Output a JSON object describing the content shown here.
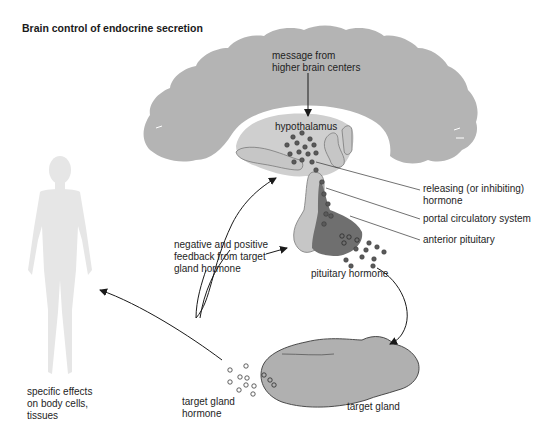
{
  "title": "Brain control of endocrine secretion",
  "colors": {
    "brain": "#b4b4b4",
    "hypothalamus": "#cfcfcf",
    "posterior_pituitary": "#c2c2c2",
    "anterior_pituitary": "#6f6f6f",
    "hormone_dot_dark": "#5a5a5a",
    "target_gland": "#b0b0b0",
    "body_silhouette": "#e6e6e6",
    "arrow": "#1a1a1a"
  },
  "labels": {
    "message": "message from\nhigher brain centers",
    "hypothalamus": "hypothalamus",
    "releasing_hormone": "releasing (or inhibiting)\nhormone",
    "portal_system": "portal circulatory system",
    "anterior_pituitary": "anterior pituitary",
    "feedback": "negative and positive\nfeedback from target\ngland hormone",
    "pituitary_hormone": "pituitary hormone",
    "target_gland_hormone": "target gland\nhormone",
    "target_gland": "target gland",
    "specific_effects": "specific effects\non body cells,\ntissues"
  },
  "structures": [
    {
      "name": "brain",
      "label": "higher brain centers"
    },
    {
      "name": "hypothalamus",
      "label": "hypothalamus"
    },
    {
      "name": "anterior pituitary",
      "label": "anterior pituitary"
    },
    {
      "name": "portal circulatory system",
      "label": "portal circulatory system"
    },
    {
      "name": "target gland",
      "label": "target gland"
    },
    {
      "name": "body",
      "label": "specific effects on body cells, tissues"
    }
  ],
  "flows": [
    {
      "from": "higher brain centers",
      "to": "hypothalamus"
    },
    {
      "from": "hypothalamus",
      "to": "anterior pituitary",
      "via": "releasing (or inhibiting) hormone"
    },
    {
      "from": "anterior pituitary",
      "to": "target gland",
      "via": "pituitary hormone"
    },
    {
      "from": "target gland",
      "to": "body cells, tissues",
      "via": "target gland hormone"
    },
    {
      "from": "target gland hormone",
      "to": "hypothalamus",
      "type": "feedback"
    },
    {
      "from": "target gland hormone",
      "to": "anterior pituitary",
      "type": "feedback"
    }
  ]
}
